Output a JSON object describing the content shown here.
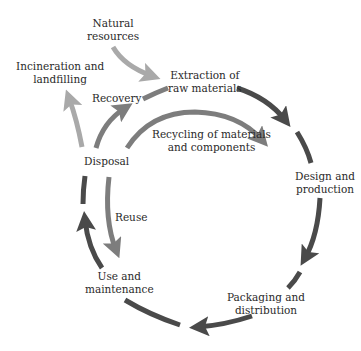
{
  "diagram": {
    "type": "product life cycle",
    "colors": {
      "main_cycle": "#4a4a4a",
      "inner_loops": "#7d7d7d",
      "external": "#a9a9a9",
      "text": "#2a2a2a",
      "background": "#ffffff"
    },
    "nodes": {
      "natural_resources": {
        "line1": "Natural",
        "line2": "resources"
      },
      "incineration": {
        "line1": "Incineration and",
        "line2": "landfilling"
      },
      "extraction": {
        "line1": "Extraction of",
        "line2": "raw materials"
      },
      "recovery": {
        "label": "Recovery"
      },
      "recycling": {
        "line1": "Recycling of materials",
        "line2": "and components"
      },
      "disposal": {
        "label": "Disposal"
      },
      "design": {
        "line1": "Design and",
        "line2": "production"
      },
      "reuse": {
        "label": "Reuse"
      },
      "use": {
        "line1": "Use and",
        "line2": "maintenance"
      },
      "packaging": {
        "line1": "Packaging and",
        "line2": "distribution"
      }
    },
    "edges": [
      {
        "from": "Natural resources",
        "to": "Extraction of raw materials",
        "style": "external"
      },
      {
        "from": "Extraction of raw materials",
        "to": "Design and production",
        "style": "main_cycle"
      },
      {
        "from": "Design and production",
        "to": "Packaging and distribution",
        "style": "main_cycle"
      },
      {
        "from": "Packaging and distribution",
        "to": "Use and maintenance",
        "style": "main_cycle"
      },
      {
        "from": "Use and maintenance",
        "to": "Disposal",
        "style": "main_cycle"
      },
      {
        "from": "Disposal",
        "to": "Extraction of raw materials",
        "label": "Recovery",
        "style": "inner_loops"
      },
      {
        "from": "Disposal",
        "to": "Design and production",
        "label": "Recycling of materials and components",
        "style": "inner_loops"
      },
      {
        "from": "Disposal",
        "to": "Use and maintenance",
        "label": "Reuse",
        "style": "inner_loops"
      },
      {
        "from": "Disposal",
        "to": "Incineration and landfilling",
        "style": "external"
      }
    ]
  }
}
